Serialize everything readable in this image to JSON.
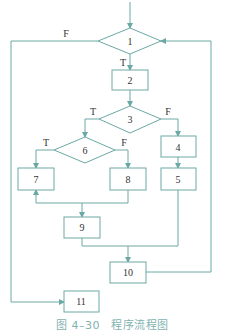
{
  "diagram": {
    "type": "program-flowchart",
    "line_color": "#6aa8a4",
    "text_color": "#333333",
    "nodes": [
      {
        "id": "1",
        "shape": "diamond",
        "label": "1"
      },
      {
        "id": "2",
        "shape": "rect",
        "label": "2"
      },
      {
        "id": "3",
        "shape": "diamond",
        "label": "3"
      },
      {
        "id": "4",
        "shape": "rect",
        "label": "4"
      },
      {
        "id": "5",
        "shape": "rect",
        "label": "5"
      },
      {
        "id": "6",
        "shape": "diamond",
        "label": "6"
      },
      {
        "id": "7",
        "shape": "rect",
        "label": "7"
      },
      {
        "id": "8",
        "shape": "rect",
        "label": "8"
      },
      {
        "id": "9",
        "shape": "rect",
        "label": "9"
      },
      {
        "id": "10",
        "shape": "rect",
        "label": "10"
      },
      {
        "id": "11",
        "shape": "rect",
        "label": "11"
      }
    ],
    "edge_labels": {
      "d1_false": "F",
      "d1_true": "T",
      "d3_true": "T",
      "d3_false": "F",
      "d6_true": "T",
      "d6_false": "F"
    },
    "edges": [
      {
        "from": "start",
        "to": "1"
      },
      {
        "from": "1",
        "to": "2",
        "label": "T"
      },
      {
        "from": "1",
        "to": "11",
        "label": "F"
      },
      {
        "from": "2",
        "to": "3"
      },
      {
        "from": "3",
        "to": "6",
        "label": "T"
      },
      {
        "from": "3",
        "to": "4",
        "label": "F"
      },
      {
        "from": "4",
        "to": "5"
      },
      {
        "from": "6",
        "to": "7",
        "label": "T"
      },
      {
        "from": "6",
        "to": "8",
        "label": "F"
      },
      {
        "from": "8",
        "to": "7"
      },
      {
        "from": "8",
        "to": "9"
      },
      {
        "from": "9",
        "to": "10"
      },
      {
        "from": "5",
        "to": "10"
      },
      {
        "from": "10",
        "to": "1"
      }
    ]
  },
  "caption": "图 4–30　程序流程图"
}
